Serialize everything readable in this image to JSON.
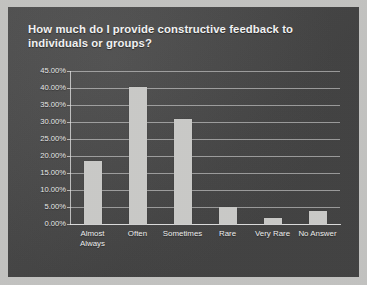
{
  "slide": {
    "title": "How much do I provide constructive feedback to individuals or groups?",
    "background_color": "#4a4a4a",
    "frame_color": "#c2c2c0",
    "text_color": "#f2f2f2"
  },
  "chart_data": {
    "type": "bar",
    "title": "How much do I provide constructive feedback to individuals or groups?",
    "categories": [
      "Almost Always",
      "Often",
      "Sometimes",
      "Rare",
      "Very Rare",
      "No Answer"
    ],
    "category_labels_wrapped": [
      "Almost\nAlways",
      "Often",
      "Sometimes",
      "Rare",
      "Very Rare",
      "No Answer"
    ],
    "values": [
      18.6,
      40.4,
      30.8,
      5.0,
      1.7,
      3.7
    ],
    "value_labels": [
      "18.60%",
      "40.40%",
      "30.80%",
      "5.00%",
      "1.70%",
      "3.70%"
    ],
    "xlabel": "",
    "ylabel": "",
    "ylim": [
      0,
      45
    ],
    "ytick_labels": [
      "45.00%",
      "40.00%",
      "35.00%",
      "30.00%",
      "25.00%",
      "20.00%",
      "15.00%",
      "10.00%",
      "5.00%",
      "0.00%"
    ],
    "ytick_values": [
      45,
      40,
      35,
      30,
      25,
      20,
      15,
      10,
      5,
      0
    ],
    "grid": true,
    "grid_axis": "y",
    "legend": false,
    "legend_position": "none",
    "bar_color": "#c9c9c7",
    "grid_color": "#e1e1e1",
    "axis_color": "#e6e6e6"
  }
}
